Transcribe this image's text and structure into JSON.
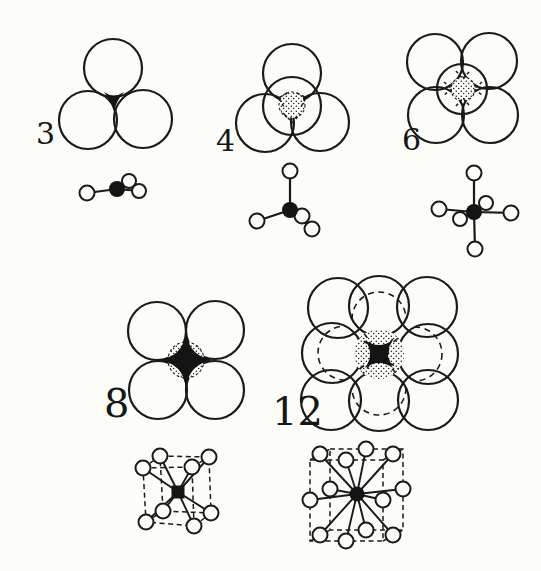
{
  "figure": {
    "groups": [
      {
        "label": "3"
      },
      {
        "label": "4"
      },
      {
        "label": "6"
      },
      {
        "label": "8"
      },
      {
        "label": "12"
      }
    ]
  },
  "colors": {
    "ink": "#1a1a1a",
    "paper": "#fcfcf8",
    "fill_black": "#141414"
  }
}
